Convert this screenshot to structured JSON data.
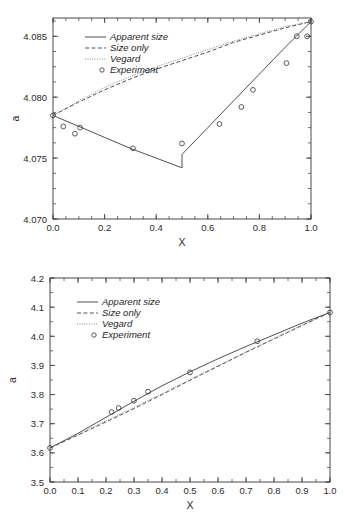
{
  "figure": {
    "background": "#ffffff",
    "ink": "#3c3c3c"
  },
  "legend": {
    "entries": [
      {
        "label": "Apparent size",
        "style": "solid"
      },
      {
        "label": "Size only",
        "style": "dashed"
      },
      {
        "label": "Vegard",
        "style": "dotted"
      },
      {
        "label": "Experiment",
        "style": "circle"
      }
    ]
  },
  "chart_data": [
    {
      "type": "line",
      "id": "top",
      "title": "",
      "xlabel": "X",
      "ylabel": "a",
      "xlim": [
        0.0,
        1.0
      ],
      "ylim": [
        4.07,
        4.0865
      ],
      "grid": false,
      "legend_position": "upper-left",
      "xticks": [
        0.0,
        0.2,
        0.4,
        0.6,
        0.8,
        1.0
      ],
      "xticklabels": [
        "0.0",
        "0.2",
        "0.4",
        "0.6",
        "0.8",
        "1.0"
      ],
      "yticks": [
        4.07,
        4.075,
        4.08,
        4.085
      ],
      "yticklabels": [
        "4.070",
        "4.075",
        "4.080",
        "4.085"
      ],
      "xminor_step": 0.05,
      "yminor_step": 0.00125,
      "series": [
        {
          "name": "Apparent size",
          "style": "solid",
          "x": [
            0.0,
            0.1,
            0.2,
            0.3,
            0.4,
            0.5,
            0.5,
            0.6,
            0.7,
            0.8,
            0.9,
            1.0
          ],
          "values": [
            4.0785,
            4.0776,
            4.0767,
            4.0758,
            4.075,
            4.0742,
            4.0753,
            4.0775,
            4.0797,
            4.0819,
            4.0841,
            4.0862
          ]
        },
        {
          "name": "Size only",
          "style": "dashed",
          "x": [
            0.0,
            0.1,
            0.2,
            0.3,
            0.4,
            0.5,
            0.6,
            0.7,
            0.8,
            0.9,
            1.0
          ],
          "values": [
            4.0785,
            4.0796,
            4.0806,
            4.0815,
            4.0823,
            4.083,
            4.0837,
            4.0845,
            4.0851,
            4.0857,
            4.0862
          ]
        },
        {
          "name": "Vegard",
          "style": "dotted",
          "x": [
            0.0,
            0.1,
            0.2,
            0.3,
            0.4,
            0.5,
            0.6,
            0.7,
            0.8,
            0.9,
            1.0
          ],
          "values": [
            4.0785,
            4.0797,
            4.0808,
            4.0817,
            4.0825,
            4.0832,
            4.0839,
            4.0846,
            4.0852,
            4.0858,
            4.0862
          ]
        },
        {
          "name": "Experiment",
          "style": "circle",
          "x": [
            0.0,
            0.04,
            0.085,
            0.105,
            0.31,
            0.5,
            0.645,
            0.73,
            0.775,
            0.905,
            0.945,
            0.985,
            1.0
          ],
          "values": [
            4.0785,
            4.0776,
            4.077,
            4.0775,
            4.0758,
            4.0762,
            4.0778,
            4.0792,
            4.0806,
            4.0828,
            4.085,
            4.085,
            4.0862
          ]
        }
      ]
    },
    {
      "type": "line",
      "id": "bottom",
      "title": "",
      "xlabel": "X",
      "ylabel": "a",
      "xlim": [
        0.0,
        1.0
      ],
      "ylim": [
        3.5,
        4.2
      ],
      "grid": false,
      "legend_position": "upper-left",
      "xticks": [
        0.0,
        0.1,
        0.2,
        0.3,
        0.4,
        0.5,
        0.6,
        0.7,
        0.8,
        0.9,
        1.0
      ],
      "xticklabels": [
        "0.0",
        "0.1",
        "0.2",
        "0.3",
        "0.4",
        "0.5",
        "0.6",
        "0.7",
        "0.8",
        "0.9",
        "1.0"
      ],
      "yticks": [
        3.5,
        3.6,
        3.7,
        3.8,
        3.9,
        4.0,
        4.1,
        4.2
      ],
      "yticklabels": [
        "3.5",
        "3.6",
        "3.7",
        "3.8",
        "3.9",
        "4.0",
        "4.1",
        "4.2"
      ],
      "xminor_step": 0.05,
      "yminor_step": 0.05,
      "series": [
        {
          "name": "Apparent size",
          "style": "solid",
          "x": [
            0.0,
            0.1,
            0.2,
            0.3,
            0.4,
            0.5,
            0.6,
            0.7,
            0.8,
            0.9,
            1.0
          ],
          "values": [
            3.617,
            3.667,
            3.722,
            3.777,
            3.83,
            3.878,
            3.923,
            3.965,
            4.005,
            4.045,
            4.082
          ]
        },
        {
          "name": "Size only",
          "style": "dashed",
          "x": [
            0.0,
            0.1,
            0.2,
            0.3,
            0.4,
            0.5,
            0.6,
            0.7,
            0.8,
            0.9,
            1.0
          ],
          "values": [
            3.617,
            3.661,
            3.706,
            3.752,
            3.8,
            3.849,
            3.897,
            3.945,
            3.991,
            4.037,
            4.082
          ]
        },
        {
          "name": "Vegard",
          "style": "dotted",
          "x": [
            0.0,
            0.1,
            0.2,
            0.3,
            0.4,
            0.5,
            0.6,
            0.7,
            0.8,
            0.9,
            1.0
          ],
          "values": [
            3.617,
            3.663,
            3.71,
            3.756,
            3.803,
            3.852,
            3.899,
            3.946,
            3.992,
            4.038,
            4.082
          ]
        },
        {
          "name": "Experiment",
          "style": "circle",
          "x": [
            0.0,
            0.22,
            0.245,
            0.3,
            0.35,
            0.5,
            0.74,
            1.0
          ],
          "values": [
            3.617,
            3.74,
            3.754,
            3.779,
            3.81,
            3.876,
            3.983,
            4.082
          ]
        }
      ]
    }
  ]
}
